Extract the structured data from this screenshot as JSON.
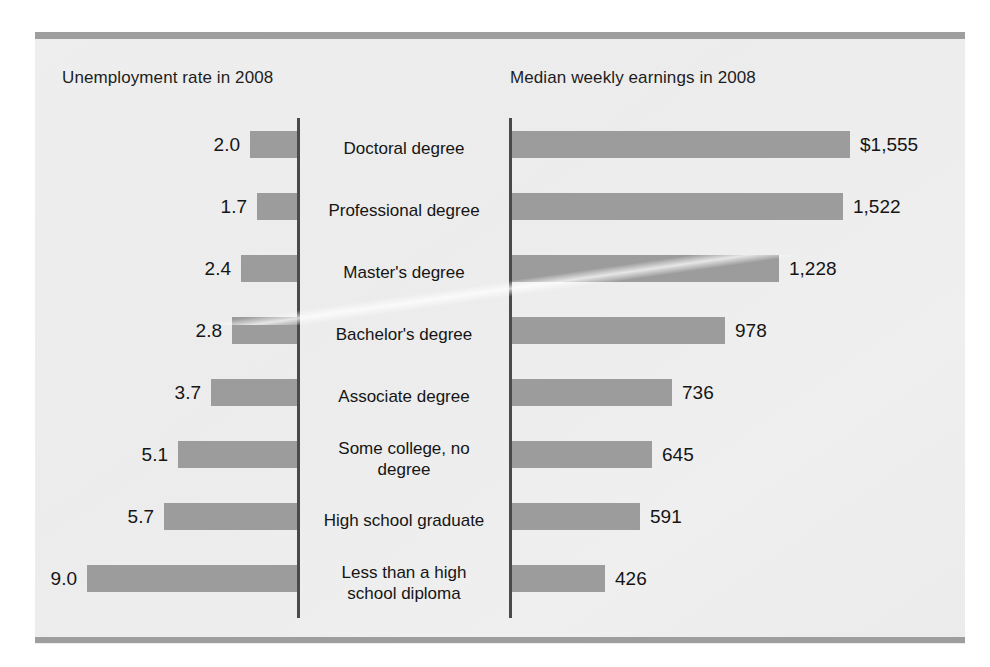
{
  "chart_data": {
    "type": "bar",
    "title": "",
    "orientation": "horizontal",
    "layout": "butterfly / back-to-back paired bar chart",
    "grid": false,
    "legend": null,
    "panels": [
      {
        "id": "unemployment",
        "title": "Unemployment rate in 2008",
        "xlabel": "",
        "ylabel": "",
        "unit": "percent",
        "direction": "right-to-left",
        "xlim": [
          0,
          9.0
        ],
        "value_label_format": "0.0"
      },
      {
        "id": "earnings",
        "title": "Median weekly earnings in 2008",
        "xlabel": "",
        "ylabel": "",
        "unit": "US dollars per week",
        "direction": "left-to-right",
        "xlim": [
          0,
          1555
        ],
        "value_label_format": "#,###"
      }
    ],
    "categories": [
      "Doctoral degree",
      "Professional degree",
      "Master's degree",
      "Bachelor's degree",
      "Associate degree",
      "Some college, no degree",
      "High school graduate",
      "Less than a high school diploma"
    ],
    "series": [
      {
        "name": "Unemployment rate in 2008",
        "panel": "unemployment",
        "unit": "percent",
        "values": [
          2.0,
          1.7,
          2.4,
          2.8,
          3.7,
          5.1,
          5.7,
          9.0
        ],
        "labels": [
          "2.0",
          "1.7",
          "2.4",
          "2.8",
          "3.7",
          "5.1",
          "5.7",
          "9.0"
        ]
      },
      {
        "name": "Median weekly earnings in 2008",
        "panel": "earnings",
        "unit": "dollars",
        "values": [
          1555,
          1522,
          1228,
          978,
          736,
          645,
          591,
          426
        ],
        "labels": [
          "$1,555",
          "1,522",
          "1,228",
          "978",
          "736",
          "645",
          "591",
          "426"
        ]
      }
    ]
  },
  "rows": [
    {
      "category": "Doctoral degree",
      "category_line1": "Doctoral degree",
      "category_line2": "",
      "rate": 2.0,
      "rate_label": "2.0",
      "earnings": 1555,
      "earnings_label": "$1,555"
    },
    {
      "category": "Professional degree",
      "category_line1": "Professional degree",
      "category_line2": "",
      "rate": 1.7,
      "rate_label": "1.7",
      "earnings": 1522,
      "earnings_label": "1,522"
    },
    {
      "category": "Master's degree",
      "category_line1": "Master's degree",
      "category_line2": "",
      "rate": 2.4,
      "rate_label": "2.4",
      "earnings": 1228,
      "earnings_label": "1,228"
    },
    {
      "category": "Bachelor's degree",
      "category_line1": "Bachelor's degree",
      "category_line2": "",
      "rate": 2.8,
      "rate_label": "2.8",
      "earnings": 978,
      "earnings_label": "978"
    },
    {
      "category": "Associate degree",
      "category_line1": "Associate degree",
      "category_line2": "",
      "rate": 3.7,
      "rate_label": "3.7",
      "earnings": 736,
      "earnings_label": "736"
    },
    {
      "category": "Some college, no degree",
      "category_line1": "Some college, no",
      "category_line2": "degree",
      "rate": 5.1,
      "rate_label": "5.1",
      "earnings": 645,
      "earnings_label": "645"
    },
    {
      "category": "High school graduate",
      "category_line1": "High school graduate",
      "category_line2": "",
      "rate": 5.7,
      "rate_label": "5.7",
      "earnings": 591,
      "earnings_label": "591"
    },
    {
      "category": "Less than a high school diploma",
      "category_line1": "Less than a high",
      "category_line2": "school diploma",
      "rate": 9.0,
      "rate_label": "9.0",
      "earnings": 426,
      "earnings_label": "426"
    }
  ],
  "headers": {
    "left": "Unemployment rate in 2008",
    "right": "Median weekly earnings in 2008"
  },
  "colors": {
    "bar": "#9c9c9c",
    "axis": "#4a4a4a",
    "rule": "#9e9e9e",
    "text": "#151515",
    "paper": "#eeeeee"
  }
}
